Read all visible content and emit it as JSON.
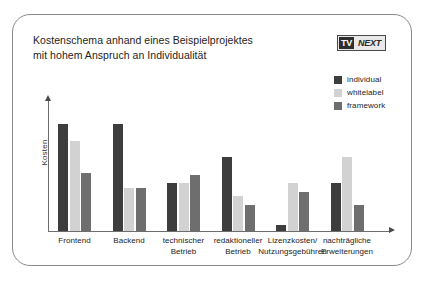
{
  "figure": {
    "title_lines": [
      "Kostenschema anhand eines Beispielprojektes",
      "mit hohem Anspruch an Individualität"
    ],
    "logo": {
      "mark": "TV",
      "word": "NEXT"
    }
  },
  "colors": {
    "individual": "#3d3d3d",
    "whitelabel": "#d2d2d2",
    "framework": "#6e6e6e",
    "axis": "#6d6d6d",
    "frame": "#8a8a8a",
    "text": "#1d1d1d"
  },
  "chart_data": {
    "type": "bar",
    "title": "Kostenschema anhand eines Beispielprojektes mit hohem Anspruch an Individualität",
    "xlabel": "",
    "ylabel": "Kosten",
    "ylim": [
      0,
      100
    ],
    "grid": false,
    "legend_position": "top-right",
    "categories": [
      "Frontend",
      "Backend",
      "technischer Betrieb",
      "redaktioneller Betrieb",
      "Lizenzkosten/ Nutzungsgebühren",
      "nachträgliche Erweiterungen"
    ],
    "category_label_lines": [
      [
        "Frontend"
      ],
      [
        "Backend"
      ],
      [
        "technischer",
        "Betrieb"
      ],
      [
        "redaktioneller",
        "Betrieb"
      ],
      [
        "Lizenzkosten/",
        "Nutzungsgebühren"
      ],
      [
        "nachträgliche",
        "Erweiterungen"
      ]
    ],
    "series": [
      {
        "name": "individual",
        "color": "#3d3d3d",
        "values": [
          82,
          82,
          37,
          57,
          5,
          37
        ]
      },
      {
        "name": "whitelabel",
        "color": "#d2d2d2",
        "values": [
          69,
          33,
          37,
          27,
          37,
          57
        ]
      },
      {
        "name": "framework",
        "color": "#6e6e6e",
        "values": [
          45,
          33,
          43,
          20,
          30,
          20
        ]
      }
    ]
  }
}
